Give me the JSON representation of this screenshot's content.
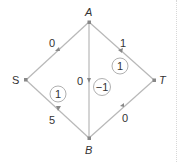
{
  "nodes": {
    "S": {
      "label": "S",
      "x": 26,
      "y": 80
    },
    "A": {
      "label": "A",
      "x": 89,
      "y": 22
    },
    "T": {
      "label": "T",
      "x": 154,
      "y": 80
    },
    "B": {
      "label": "B",
      "x": 89,
      "y": 138
    }
  },
  "edges": [
    {
      "from": "S",
      "to": "A",
      "label": "0"
    },
    {
      "from": "A",
      "to": "T",
      "label": "1"
    },
    {
      "from": "A",
      "to": "B",
      "label": "0"
    },
    {
      "from": "B",
      "to": "S",
      "label": "5"
    },
    {
      "from": "B",
      "to": "T",
      "label": "0"
    }
  ],
  "cycle_values": [
    {
      "region": "A-T-B",
      "value": "1"
    },
    {
      "region": "A-B",
      "value": "−1"
    },
    {
      "region": "S-A-B",
      "value": "1"
    }
  ],
  "colors": {
    "edge": "#b8b8b8",
    "text": "#333333",
    "node": "#888888"
  }
}
